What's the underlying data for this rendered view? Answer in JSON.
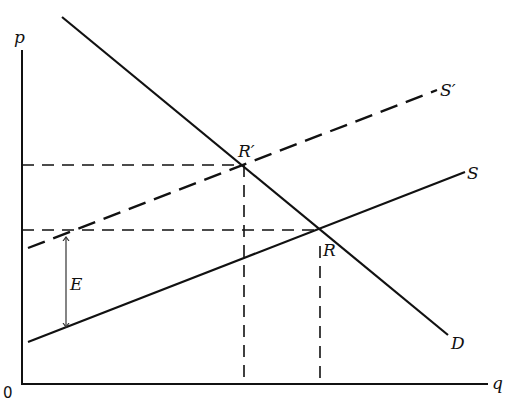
{
  "diagram": {
    "axes": {
      "y_label": "p",
      "x_label": "q",
      "origin_label": "0"
    },
    "curves": {
      "demand": {
        "label": "D",
        "style": "solid"
      },
      "supply": {
        "label": "S",
        "style": "solid"
      },
      "supply_shifted": {
        "label": "S′",
        "style": "dashed"
      }
    },
    "points": {
      "original_equilibrium": {
        "label": "R"
      },
      "new_equilibrium": {
        "label": "R′"
      }
    },
    "annotations": {
      "vertical_shift": {
        "label": "E",
        "description": "vertical distance between S and S′"
      }
    },
    "guides": [
      "horizontal dashed line from p-axis to R′",
      "horizontal dashed line from p-axis to R",
      "vertical dashed line from R′ to q-axis",
      "vertical dashed line from R to q-axis"
    ]
  }
}
